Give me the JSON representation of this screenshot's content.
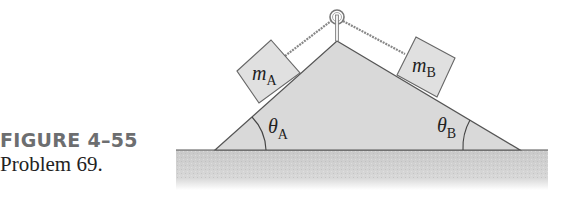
{
  "caption": {
    "figure_label": "FIGURE 4–55",
    "problem_label": "Problem 69."
  },
  "diagram": {
    "block_a": {
      "symbol": "m",
      "subscript": "A"
    },
    "block_b": {
      "symbol": "m",
      "subscript": "B"
    },
    "angle_a": {
      "symbol": "θ",
      "subscript": "A"
    },
    "angle_b": {
      "symbol": "θ",
      "subscript": "B"
    },
    "colors": {
      "wedge": "#d9d9d9",
      "block": "#e0e0e0",
      "ground": "#cfcfcf",
      "outline": "#555555",
      "caption_label": "#6d6e70"
    }
  }
}
